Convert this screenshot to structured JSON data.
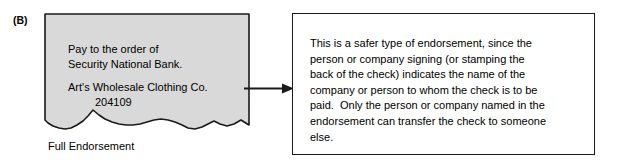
{
  "figure": {
    "panel_label": "(B)",
    "type": "endorsement-illustration"
  },
  "check": {
    "caption": "Full Endorsement",
    "fill_color": "#d9d9d9",
    "border_color": "#1a1a1a",
    "lines": [
      "Pay to the order of",
      "Security National Bank.",
      "Art's Wholesale Clothing Co.",
      "204109"
    ],
    "line_pay": "Pay to the order of",
    "line_bank": "Security National Bank.",
    "line_company": "Art's Wholesale Clothing Co.",
    "line_number": "204109"
  },
  "connector": {
    "icon": "arrow-right-icon",
    "direction": "right",
    "color": "#1a1a1a"
  },
  "description": {
    "full_text": "This is a safer type of endorsement, since the person or company signing (or stamping the back of the check) indicates the name of the company or person to whom the check is to be paid.  Only the person or company named in the endorsement can transfer the check to someone else.",
    "lines": [
      "This is a safer type of endorsement, since the",
      "person or company signing (or stamping the",
      "back of the check) indicates the name of the",
      "company or person to whom the check is to be",
      "paid.  Only the person or company named in the",
      "endorsement can transfer the check to someone",
      "else."
    ]
  }
}
